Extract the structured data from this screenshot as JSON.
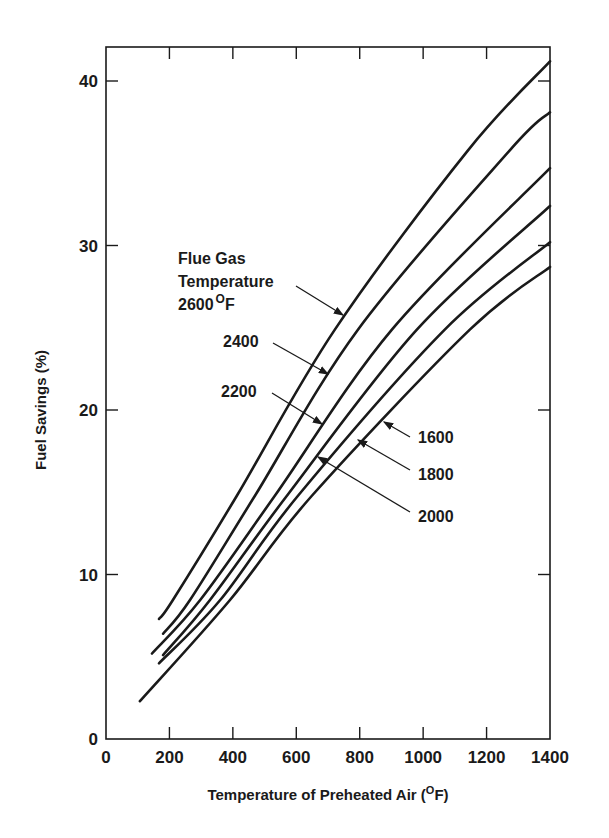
{
  "chart_data": {
    "type": "line",
    "title": "",
    "xlabel": "Temperature of Preheated Air (°F)",
    "ylabel": "Fuel Savings (%)",
    "xlim": [
      0,
      1400
    ],
    "ylim": [
      0,
      42
    ],
    "x_ticks": [
      0,
      200,
      400,
      600,
      800,
      1000,
      1200,
      1400
    ],
    "y_ticks": [
      0,
      10,
      20,
      30,
      40
    ],
    "grid": false,
    "legend": "inline annotations with arrows",
    "annotation_title": [
      "Flue Gas",
      "Temperature"
    ],
    "series": [
      {
        "name": "2600°F",
        "label": "2600",
        "x": [
          167,
          211,
          413,
          722,
          1142,
          1400
        ],
        "y": [
          7.3,
          8.45,
          14.8,
          24.9,
          35.8,
          41.2
        ]
      },
      {
        "name": "2400°F",
        "label": "2400",
        "x": [
          180,
          265,
          470,
          795,
          1274,
          1400
        ],
        "y": [
          6.4,
          8.45,
          14.8,
          24.9,
          35.8,
          38.1
        ]
      },
      {
        "name": "2200°F",
        "label": "2200",
        "x": [
          145,
          297,
          533,
          902,
          1400
        ],
        "y": [
          5.2,
          8.45,
          14.8,
          24.9,
          34.7
        ]
      },
      {
        "name": "2000°F",
        "label": "2000",
        "x": [
          180,
          328,
          571,
          981,
          1400
        ],
        "y": [
          5.1,
          8.45,
          14.8,
          24.9,
          32.4
        ]
      },
      {
        "name": "1800°F",
        "label": "1800",
        "x": [
          167,
          360,
          606,
          1069,
          1400
        ],
        "y": [
          4.6,
          8.45,
          14.8,
          24.9,
          30.2
        ]
      },
      {
        "name": "1600°F",
        "label": "1600",
        "x": [
          107,
          391,
          650,
          1148,
          1400
        ],
        "y": [
          2.3,
          8.45,
          14.8,
          24.9,
          28.7
        ]
      }
    ]
  },
  "labels": {
    "xlabel_main": "Temperature of Preheated Air (",
    "xlabel_sup": "O",
    "xlabel_end": "F)",
    "ylabel": "Fuel Savings (%)",
    "anno_line1": "Flue Gas",
    "anno_line2": "Temperature",
    "anno_2600": "2600",
    "anno_deg": "O",
    "anno_f": "F",
    "anno_2400": "2400",
    "anno_2200": "2200",
    "anno_2000": "2000",
    "anno_1800": "1800",
    "anno_1600": "1600"
  },
  "colors": {
    "ink": "#1a1a1a",
    "background": "#ffffff"
  }
}
